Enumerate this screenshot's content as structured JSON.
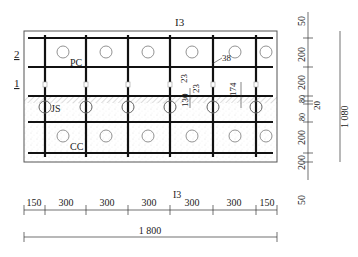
{
  "diagram": {
    "section_marks": {
      "top": "I3",
      "bottom": "I3"
    },
    "layer_marks": [
      "2",
      "1"
    ],
    "zone_labels": {
      "pc": "PC",
      "js": "JS",
      "cc": "CC"
    },
    "inner_dims": {
      "d38": "38",
      "d130": "130",
      "d23a": "23",
      "d23b": "23",
      "d174": "174"
    },
    "right_dims": [
      "50",
      "200",
      "200",
      "80",
      "80",
      "20",
      "200",
      "200",
      "50"
    ],
    "right_total": "1 080",
    "bottom_dims": [
      "150",
      "300",
      "300",
      "300",
      "300",
      "300",
      "150"
    ],
    "bottom_total": "1 800",
    "colors": {
      "bar": "#111111",
      "outline": "#555555",
      "hatch": "#999999",
      "circle": "#777777",
      "stipple": "#bbbbbb"
    }
  }
}
